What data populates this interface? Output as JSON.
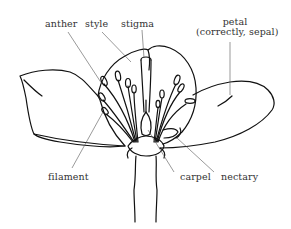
{
  "diagram": {
    "labels": {
      "anther": "anther",
      "style": "style",
      "stigma": "stigma",
      "petal_line1": "petal",
      "petal_line2": "(correctly, sepal)",
      "filament": "filament",
      "carpel": "carpel",
      "nectary": "nectary"
    },
    "colors": {
      "ink": "#111111",
      "leader_line": "#555555",
      "background": "#ffffff"
    }
  }
}
